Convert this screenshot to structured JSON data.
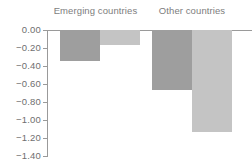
{
  "chart_data": {
    "type": "bar",
    "title": "",
    "subtitle": "",
    "xlabel": "",
    "ylabel": "",
    "ylim": [
      -1.4,
      0.0
    ],
    "grid": false,
    "legend_position": "none",
    "orientation": "vertical",
    "categories": [
      "Emerging countries",
      "Other countries"
    ],
    "series": [
      {
        "name": "series-1",
        "color": "#9e9e9e",
        "values": [
          -0.34,
          -0.67
        ]
      },
      {
        "name": "series-2",
        "color": "#c4c4c4",
        "values": [
          -0.17,
          -1.13
        ]
      }
    ],
    "y_ticks": [
      {
        "value": 0.0,
        "label": "0.00"
      },
      {
        "value": -0.2,
        "label": "−0.20"
      },
      {
        "value": -0.4,
        "label": "−0.40"
      },
      {
        "value": -0.6,
        "label": "−0.60"
      },
      {
        "value": -0.8,
        "label": "−0.80"
      },
      {
        "value": -1.0,
        "label": "−1.00"
      },
      {
        "value": -1.2,
        "label": "−1.20"
      },
      {
        "value": -1.4,
        "label": "−1.40"
      }
    ]
  },
  "colors": {
    "axis": "#9a9a9a",
    "tick_text": "#6f6f6f",
    "group_label_text": "#7d7d7d",
    "background": "#ffffff",
    "series_1": "#9e9e9e",
    "series_2": "#c4c4c4"
  }
}
